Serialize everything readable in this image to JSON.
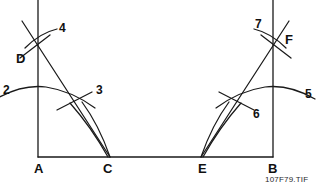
{
  "figure": {
    "caption": "107F79.TIF",
    "stroke_color": "#1a1a1a",
    "background_color": "#ffffff",
    "points": [
      {
        "id": "A",
        "label": "A",
        "x": 38,
        "y": 157
      },
      {
        "id": "C",
        "label": "C",
        "x": 108,
        "y": 157
      },
      {
        "id": "E",
        "label": "E",
        "x": 203,
        "y": 157
      },
      {
        "id": "B",
        "label": "B",
        "x": 273,
        "y": 157
      },
      {
        "id": "D",
        "label": "D",
        "x": 38,
        "y": 42
      },
      {
        "id": "F",
        "label": "F",
        "x": 273,
        "y": 42
      }
    ],
    "arc_labels": [
      {
        "id": "2",
        "label": "2",
        "x": 3,
        "y": 84
      },
      {
        "id": "3",
        "label": "3",
        "x": 96,
        "y": 84
      },
      {
        "id": "4",
        "label": "4",
        "x": 59,
        "y": 22
      },
      {
        "id": "5",
        "label": "5",
        "x": 305,
        "y": 88
      },
      {
        "id": "6",
        "label": "6",
        "x": 253,
        "y": 108
      },
      {
        "id": "7",
        "label": "7",
        "x": 255,
        "y": 18
      }
    ]
  }
}
